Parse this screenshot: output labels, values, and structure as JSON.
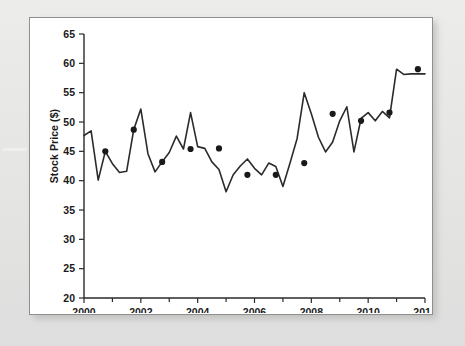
{
  "figure": {
    "panel_name": "stock-price-line-chart"
  },
  "chart_data": {
    "type": "line",
    "title": "",
    "subtitle": "",
    "xlabel": "",
    "ylabel": "Stock Price ($)",
    "xlim": [
      2000,
      2012
    ],
    "ylim": [
      20,
      65
    ],
    "grid": false,
    "legend": "none",
    "x_ticks_major": [
      2000,
      2002,
      2004,
      2006,
      2008,
      2010,
      2012
    ],
    "x_tick_labels": [
      "2000",
      "2002",
      "2004",
      "2006",
      "2008",
      "2010",
      "2012"
    ],
    "x_ticks_minor": [
      2001,
      2003,
      2005,
      2007,
      2009,
      2011
    ],
    "y_ticks": [
      20,
      25,
      30,
      35,
      40,
      45,
      50,
      55,
      60,
      65
    ],
    "y_tick_labels": [
      "20",
      "25",
      "30",
      "35",
      "40",
      "45",
      "50",
      "55",
      "60",
      "65"
    ],
    "line_color": "#2b2b2b",
    "marker_color": "#1a1a1a",
    "marker_note": "Filled circular markers placed at yearly sample points along the series",
    "x": [
      2000.0,
      2000.25,
      2000.5,
      2000.75,
      2001.0,
      2001.25,
      2001.5,
      2001.75,
      2002.0,
      2002.25,
      2002.5,
      2002.75,
      2003.0,
      2003.25,
      2003.5,
      2003.75,
      2004.0,
      2004.25,
      2004.5,
      2004.75,
      2005.0,
      2005.25,
      2005.5,
      2005.75,
      2006.0,
      2006.25,
      2006.5,
      2006.75,
      2007.0,
      2007.25,
      2007.5,
      2007.75,
      2008.0,
      2008.25,
      2008.5,
      2008.75,
      2009.0,
      2009.25,
      2009.5,
      2009.75,
      2010.0,
      2010.25,
      2010.5,
      2010.75,
      2011.0,
      2011.25,
      2011.5,
      2011.75,
      2012.0
    ],
    "values": [
      47.7,
      48.5,
      40.1,
      45.0,
      42.9,
      41.4,
      41.6,
      48.7,
      52.2,
      44.6,
      41.5,
      43.2,
      44.8,
      47.6,
      45.4,
      51.6,
      45.8,
      45.5,
      43.2,
      41.9,
      38.1,
      41.0,
      42.5,
      43.7,
      42.1,
      41.0,
      43.0,
      42.4,
      39.0,
      43.0,
      47.2,
      55.0,
      51.4,
      47.4,
      44.9,
      46.6,
      50.2,
      52.6,
      44.9,
      50.6,
      51.6,
      50.2,
      51.8,
      50.7,
      59.0,
      58.1,
      58.2,
      58.2,
      58.2
    ],
    "marker_points": [
      {
        "x": 2000.75,
        "y": 45.0
      },
      {
        "x": 2001.75,
        "y": 48.7
      },
      {
        "x": 2002.75,
        "y": 43.2
      },
      {
        "x": 2003.75,
        "y": 45.4
      },
      {
        "x": 2004.75,
        "y": 45.5
      },
      {
        "x": 2005.75,
        "y": 41.0
      },
      {
        "x": 2006.75,
        "y": 41.0
      },
      {
        "x": 2007.75,
        "y": 43.0
      },
      {
        "x": 2008.75,
        "y": 51.4
      },
      {
        "x": 2009.75,
        "y": 50.2
      },
      {
        "x": 2010.75,
        "y": 51.6
      },
      {
        "x": 2011.75,
        "y": 59.0
      }
    ]
  }
}
